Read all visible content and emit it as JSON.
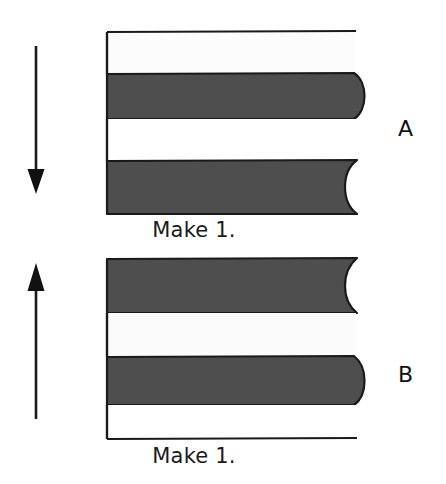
{
  "document": {
    "type": "sewing-cutting-diagram",
    "background_color": "#ffffff",
    "fabric_dark_color": "#4e4e4e",
    "fabric_light_color": "#fdfdfd",
    "outline_color": "#1a1a1a"
  },
  "panels": [
    {
      "id": "A",
      "label": "A",
      "caption": "Make 1.",
      "grain_arrow": {
        "name": "down-arrow",
        "direction": "down"
      },
      "strips": [
        {
          "index": 1,
          "shade": "light",
          "right_edge": "straight"
        },
        {
          "index": 2,
          "shade": "dark",
          "right_edge": "convex"
        },
        {
          "index": 3,
          "shade": "light",
          "right_edge": "straight"
        },
        {
          "index": 4,
          "shade": "dark",
          "right_edge": "concave"
        }
      ]
    },
    {
      "id": "B",
      "label": "B",
      "caption": "Make 1.",
      "grain_arrow": {
        "name": "up-arrow",
        "direction": "up"
      },
      "strips": [
        {
          "index": 1,
          "shade": "dark",
          "right_edge": "concave"
        },
        {
          "index": 2,
          "shade": "light",
          "right_edge": "straight"
        },
        {
          "index": 3,
          "shade": "dark",
          "right_edge": "convex"
        },
        {
          "index": 4,
          "shade": "light",
          "right_edge": "straight"
        }
      ]
    }
  ]
}
